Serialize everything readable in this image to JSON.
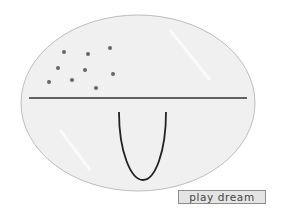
{
  "scene": {
    "ellipse": {
      "cx": 138,
      "cy": 103,
      "rx": 117,
      "ry": 88,
      "fill": "#f0f0f0",
      "stroke": "#bdbdbd"
    },
    "horizon_line": {
      "x1": 29,
      "y1": 98,
      "x2": 247,
      "y2": 98,
      "color": "#333333"
    },
    "dots": [
      {
        "x": 64,
        "y": 52
      },
      {
        "x": 88,
        "y": 54
      },
      {
        "x": 110,
        "y": 48
      },
      {
        "x": 58,
        "y": 68
      },
      {
        "x": 85,
        "y": 70
      },
      {
        "x": 113,
        "y": 74
      },
      {
        "x": 49,
        "y": 82
      },
      {
        "x": 72,
        "y": 80
      },
      {
        "x": 96,
        "y": 88
      }
    ],
    "dot_color": "#666666",
    "u_curve": {
      "left_x": 119,
      "right_x": 166,
      "top_y": 112,
      "bottom_x": 143,
      "bottom_y": 180,
      "color": "#222222"
    }
  },
  "controls": {
    "play_button_label": "play dream"
  }
}
